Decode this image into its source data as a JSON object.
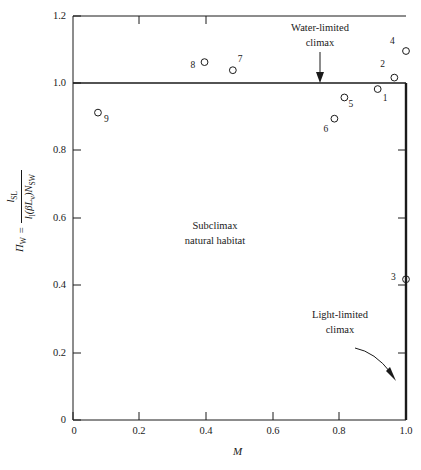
{
  "chart_data": {
    "type": "scatter",
    "title": "",
    "xlabel": "M",
    "ylabel_plain": "Π_w = l_SL / [l_l(βL_v)N_SW]",
    "xlim": [
      0,
      1.0
    ],
    "ylim": [
      0,
      1.2
    ],
    "xticks": [
      0,
      0.2,
      0.4,
      0.6,
      0.8,
      1.0
    ],
    "xtick_labels": [
      "0",
      "0.2",
      "0.4",
      "0.6",
      "0.8",
      "1.0"
    ],
    "yticks": [
      0,
      0.2,
      0.4,
      0.6,
      0.8,
      1.0,
      1.2
    ],
    "ytick_labels": [
      "0",
      "0.2",
      "0.4",
      "0.6",
      "0.8",
      "1.0",
      "1.2"
    ],
    "grid": false,
    "legend": "none",
    "marker": "open-circle",
    "points": [
      {
        "label": "1",
        "x": 0.915,
        "y": 0.983,
        "label_dx": 8,
        "label_dy": 11
      },
      {
        "label": "2",
        "x": 0.965,
        "y": 1.017,
        "label_dx": -11,
        "label_dy": -12
      },
      {
        "label": "3",
        "x": 1.0,
        "y": 0.418,
        "label_dx": -12,
        "label_dy": 0
      },
      {
        "label": "4",
        "x": 1.0,
        "y": 1.096,
        "label_dx": -13,
        "label_dy": -8
      },
      {
        "label": "5",
        "x": 0.815,
        "y": 0.958,
        "label_dx": 7,
        "label_dy": 9
      },
      {
        "label": "6",
        "x": 0.785,
        "y": 0.895,
        "label_dx": -8,
        "label_dy": 12
      },
      {
        "label": "7",
        "x": 0.48,
        "y": 1.039,
        "label_dx": 8,
        "label_dy": -9
      },
      {
        "label": "8",
        "x": 0.395,
        "y": 1.063,
        "label_dx": -11,
        "label_dy": 5
      },
      {
        "label": "9",
        "x": 0.075,
        "y": 0.913,
        "label_dx": 9,
        "label_dy": 8
      }
    ],
    "reference_lines": [
      {
        "name": "water-limited-climax-line",
        "orientation": "horizontal",
        "y": 1.0
      },
      {
        "name": "light-limited-climax-line",
        "orientation": "vertical",
        "x": 1.0
      }
    ],
    "annotations": [
      {
        "name": "water-limited-climax",
        "text_line1": "Water-limited",
        "text_line2": "climax",
        "arrow": "down",
        "points_to_x": 0.73,
        "points_to_y": 1.0
      },
      {
        "name": "subclimax-region",
        "text_line1": "Subclimax",
        "text_line2": "natural habitat"
      },
      {
        "name": "light-limited-climax",
        "text_line1": "Light-limited",
        "text_line2": "climax",
        "arrow": "curved-right-down",
        "points_to_x": 1.0,
        "points_to_y": 0.16
      }
    ]
  },
  "ylabel": {
    "symbol": "Π",
    "symbol_sub": "W",
    "equals": "=",
    "numerator": "l",
    "numerator_sub": "SL",
    "denominator_a": "l",
    "denominator_a_sub": "l",
    "denominator_b": "(βL",
    "denominator_b_sub": "v",
    "denominator_c": ")N",
    "denominator_c_sub": "SW"
  },
  "colors": {
    "axis": "#1a1a1a",
    "marker_stroke": "#1a1a1a",
    "background": "#ffffff",
    "text": "#1a1a1a"
  }
}
